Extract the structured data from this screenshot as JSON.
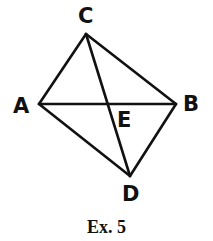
{
  "figure": {
    "caption": "Ex. 5",
    "points": {
      "A": {
        "label": "A",
        "x": 39,
        "y": 104
      },
      "B": {
        "label": "B",
        "x": 176,
        "y": 104
      },
      "C": {
        "label": "C",
        "x": 86,
        "y": 34
      },
      "D": {
        "label": "D",
        "x": 130,
        "y": 176
      },
      "E": {
        "label": "E",
        "x": 108,
        "y": 104
      }
    },
    "segments": [
      [
        "A",
        "C"
      ],
      [
        "C",
        "B"
      ],
      [
        "B",
        "D"
      ],
      [
        "D",
        "A"
      ],
      [
        "A",
        "B"
      ],
      [
        "C",
        "D"
      ]
    ],
    "stroke_color": "#111111"
  }
}
